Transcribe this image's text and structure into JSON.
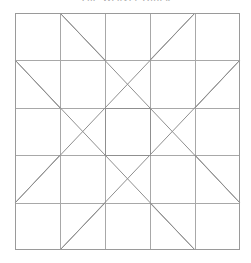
{
  "page": {
    "width": 251,
    "height": 263,
    "background": "#ffffff"
  },
  "title": {
    "text": "The Weaver Block",
    "color": "#aaaaaa",
    "clipped_at_top": true
  },
  "block": {
    "name": "quilt-block-diagram",
    "type": "pieced quilt block line drawing",
    "grid": {
      "columns": 5,
      "rows": 5,
      "x_lines": [
        15,
        60,
        105,
        150,
        195,
        240
      ],
      "y_lines": [
        13,
        60,
        108,
        155,
        203,
        250
      ]
    },
    "colors": {
      "border": "#9a9a9a",
      "grid_line": "#a8a8a8",
      "diagonal_line": "#8f8f8f",
      "fill": "#ffffff"
    },
    "stroke_widths": {
      "border": 1,
      "grid": 1,
      "diagonal": 1
    },
    "center_square": {
      "x": 105,
      "y": 108,
      "width": 45,
      "height": 47
    },
    "diagonals": [
      {
        "name": "main-x-top-left-to-bottom-right",
        "x1": 15,
        "y1": 60,
        "x2": 195,
        "y2": 250
      },
      {
        "name": "main-x-top-right-to-bottom-left",
        "x1": 240,
        "y1": 60,
        "x2": 60,
        "y2": 250
      },
      {
        "name": "main-x-bottom-left-to-top-right",
        "x1": 15,
        "y1": 203,
        "x2": 195,
        "y2": 13
      },
      {
        "name": "main-x-bottom-right-to-top-left",
        "x1": 240,
        "y1": 203,
        "x2": 60,
        "y2": 13
      },
      {
        "name": "corner-notch-top-left",
        "x1": 60,
        "y1": 13,
        "x2": 105,
        "y2": 60
      },
      {
        "name": "corner-notch-top-right",
        "x1": 195,
        "y1": 13,
        "x2": 150,
        "y2": 60
      },
      {
        "name": "corner-notch-bottom-left",
        "x1": 60,
        "y1": 250,
        "x2": 105,
        "y2": 203
      },
      {
        "name": "corner-notch-bottom-right",
        "x1": 195,
        "y1": 250,
        "x2": 150,
        "y2": 203
      },
      {
        "name": "notch-left-top",
        "x1": 15,
        "y1": 60,
        "x2": 60,
        "y2": 108
      },
      {
        "name": "notch-left-bottom",
        "x1": 15,
        "y1": 203,
        "x2": 60,
        "y2": 155
      },
      {
        "name": "notch-right-top",
        "x1": 240,
        "y1": 60,
        "x2": 195,
        "y2": 108
      },
      {
        "name": "notch-right-bottom",
        "x1": 240,
        "y1": 203,
        "x2": 195,
        "y2": 155
      }
    ]
  }
}
